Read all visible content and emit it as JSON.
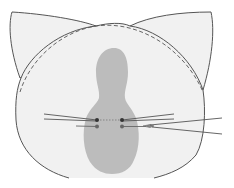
{
  "diagram": {
    "type": "anatomical-illustration",
    "colors": {
      "background": "#ffffff",
      "face_fill": "#f1f1f1",
      "outline": "#555555",
      "shaded_region": "#bcbcbc",
      "suture_line": "#555555",
      "suture_point": "#444444",
      "needle": "#888888"
    },
    "elements": [
      {
        "name": "head-outline",
        "style": "solid"
      },
      {
        "name": "left-ear",
        "style": "solid"
      },
      {
        "name": "right-ear",
        "style": "solid"
      },
      {
        "name": "ear-base-boundary",
        "style": "dashed"
      },
      {
        "name": "midline-shaded-region",
        "style": "filled"
      },
      {
        "name": "suture-points",
        "count": 4
      },
      {
        "name": "suture-threads",
        "count": 6
      },
      {
        "name": "needle",
        "count": 1
      }
    ],
    "labels": []
  }
}
